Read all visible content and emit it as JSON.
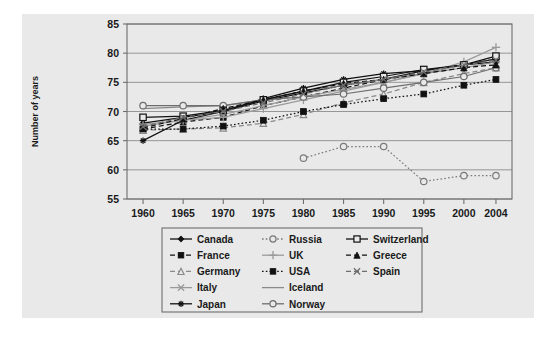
{
  "figure": {
    "background_color": "#e9e9e9",
    "plot_background_color": "#e9e9e9",
    "axis_color": "#6e6e6e",
    "gridline_color": "#8c8c8c"
  },
  "axes": {
    "ylabel": "Number of years",
    "xlabel": "",
    "yticks": [
      "85",
      "80",
      "75",
      "70",
      "65",
      "60",
      "55"
    ],
    "xticks": [
      "1960",
      "1965",
      "1970",
      "1975",
      "1980",
      "1985",
      "1990",
      "1995",
      "2000",
      "2004"
    ]
  },
  "legend": {
    "position": "below-plot",
    "columns": 3,
    "entries": [
      {
        "label": "Canada",
        "marker": "filled-diamond",
        "line": "solid",
        "color": "#111111"
      },
      {
        "label": "Russia",
        "marker": "open-circle",
        "line": "dotted",
        "color": "#7a7a7a"
      },
      {
        "label": "Switzerland",
        "marker": "open-square",
        "line": "solid",
        "color": "#111111"
      },
      {
        "label": "France",
        "marker": "filled-square",
        "line": "dashed",
        "color": "#111111"
      },
      {
        "label": "UK",
        "marker": "plus",
        "line": "solid",
        "color": "#9a9a9a"
      },
      {
        "label": "Greece",
        "marker": "filled-triangle",
        "line": "dashed",
        "color": "#111111"
      },
      {
        "label": "Germany",
        "marker": "open-triangle",
        "line": "dashed",
        "color": "#8a8a8a"
      },
      {
        "label": "USA",
        "marker": "filled-square",
        "line": "dotted",
        "color": "#111111"
      },
      {
        "label": "Spain",
        "marker": "x-mark",
        "line": "dashed",
        "color": "#6e6e6e"
      },
      {
        "label": "Italy",
        "marker": "x-mark",
        "line": "solid",
        "color": "#9a9a9a"
      },
      {
        "label": "Iceland",
        "marker": "none",
        "line": "solid",
        "color": "#8a8a8a"
      },
      {
        "label": "Japan",
        "marker": "asterisk",
        "line": "solid",
        "color": "#111111"
      },
      {
        "label": "Norway",
        "marker": "open-circle",
        "line": "solid",
        "color": "#6e6e6e"
      }
    ]
  },
  "chart_data": {
    "type": "line",
    "title": "",
    "xlabel": "",
    "ylabel": "Number of years",
    "x": [
      1960,
      1965,
      1970,
      1975,
      1980,
      1985,
      1990,
      1995,
      2000,
      2004
    ],
    "xlim": [
      1958,
      2006
    ],
    "ylim": [
      55,
      85
    ],
    "grid": true,
    "legend_position": "below",
    "series": [
      {
        "name": "Canada",
        "marker": "filled-diamond",
        "line": "solid",
        "color": "#111111",
        "x": [
          1960,
          1965,
          1970,
          1975,
          1980,
          1985,
          1990,
          1995,
          2000,
          2004
        ],
        "values": [
          68.0,
          69.0,
          70.0,
          71.8,
          73.2,
          74.5,
          75.5,
          77.0,
          78.0,
          78.5
        ]
      },
      {
        "name": "France",
        "marker": "filled-square",
        "line": "dashed",
        "color": "#111111",
        "x": [
          1960,
          1965,
          1970,
          1975,
          1980,
          1985,
          1990,
          1995,
          2000,
          2004
        ],
        "values": [
          67.0,
          68.2,
          69.0,
          71.0,
          72.5,
          74.0,
          75.5,
          76.8,
          78.0,
          79.0
        ]
      },
      {
        "name": "Germany",
        "marker": "open-triangle",
        "line": "dashed",
        "color": "#8a8a8a",
        "x": [
          1960,
          1965,
          1970,
          1975,
          1980,
          1985,
          1990,
          1995,
          2000,
          2004
        ],
        "values": [
          66.8,
          67.0,
          67.2,
          68.0,
          69.5,
          71.5,
          73.0,
          75.0,
          76.5,
          77.5
        ]
      },
      {
        "name": "Italy",
        "marker": "x-mark",
        "line": "solid",
        "color": "#9a9a9a",
        "x": [
          1960,
          1965,
          1970,
          1975,
          1980,
          1985,
          1990,
          1995,
          2000,
          2004
        ],
        "values": [
          67.5,
          68.5,
          69.5,
          71.0,
          72.5,
          73.8,
          75.0,
          76.5,
          78.0,
          79.0
        ]
      },
      {
        "name": "Japan",
        "marker": "asterisk",
        "line": "solid",
        "color": "#111111",
        "x": [
          1960,
          1965,
          1970,
          1975,
          1980,
          1985,
          1990,
          1995,
          2000,
          2004
        ],
        "values": [
          65.0,
          68.5,
          70.0,
          72.2,
          74.0,
          75.5,
          76.5,
          77.0,
          78.0,
          79.0
        ]
      },
      {
        "name": "Russia",
        "marker": "open-circle",
        "line": "dotted",
        "color": "#7a7a7a",
        "x": [
          1980,
          1985,
          1990,
          1995,
          2000,
          2004
        ],
        "values": [
          62.0,
          64.0,
          64.0,
          58.0,
          59.0,
          59.0
        ]
      },
      {
        "name": "UK",
        "marker": "plus",
        "line": "solid",
        "color": "#9a9a9a",
        "x": [
          1960,
          1965,
          1970,
          1975,
          1980,
          1985,
          1990,
          1995,
          2000,
          2004
        ],
        "values": [
          67.8,
          68.5,
          69.0,
          70.5,
          72.0,
          73.5,
          75.0,
          76.5,
          78.5,
          81.0
        ]
      },
      {
        "name": "USA",
        "marker": "filled-square",
        "line": "dotted",
        "color": "#111111",
        "x": [
          1960,
          1965,
          1970,
          1975,
          1980,
          1985,
          1990,
          1995,
          2000,
          2004
        ],
        "values": [
          67.0,
          67.0,
          67.5,
          68.5,
          70.0,
          71.2,
          72.2,
          73.0,
          74.5,
          75.5
        ]
      },
      {
        "name": "Iceland",
        "marker": "none",
        "line": "solid",
        "color": "#8a8a8a",
        "x": [
          1960,
          1965,
          1970,
          1975,
          1980,
          1985,
          1990,
          1995,
          2000,
          2004
        ],
        "values": [
          70.5,
          70.8,
          71.0,
          72.0,
          73.5,
          74.5,
          75.5,
          76.5,
          77.5,
          78.5
        ]
      },
      {
        "name": "Norway",
        "marker": "open-circle",
        "line": "solid",
        "color": "#6e6e6e",
        "x": [
          1960,
          1965,
          1970,
          1975,
          1980,
          1985,
          1990,
          1995,
          2000,
          2004
        ],
        "values": [
          71.0,
          71.0,
          71.0,
          72.0,
          72.5,
          73.0,
          74.0,
          75.0,
          76.0,
          77.5
        ]
      },
      {
        "name": "Switzerland",
        "marker": "open-square",
        "line": "solid",
        "color": "#111111",
        "x": [
          1960,
          1965,
          1970,
          1975,
          1980,
          1985,
          1990,
          1995,
          2000,
          2004
        ],
        "values": [
          69.0,
          69.2,
          70.2,
          72.0,
          73.5,
          75.0,
          76.0,
          77.2,
          78.0,
          79.5
        ]
      },
      {
        "name": "Greece",
        "marker": "filled-triangle",
        "line": "dashed",
        "color": "#111111",
        "x": [
          1960,
          1965,
          1970,
          1975,
          1980,
          1985,
          1990,
          1995,
          2000,
          2004
        ],
        "values": [
          67.2,
          68.8,
          70.5,
          72.0,
          73.5,
          74.8,
          75.5,
          76.5,
          77.5,
          78.0
        ]
      },
      {
        "name": "Spain",
        "marker": "x-mark",
        "line": "dashed",
        "color": "#6e6e6e",
        "x": [
          1960,
          1965,
          1970,
          1975,
          1980,
          1985,
          1990,
          1995,
          2000,
          2004
        ],
        "values": [
          67.4,
          69.0,
          70.0,
          71.5,
          73.0,
          74.5,
          75.5,
          76.8,
          78.0,
          78.8
        ]
      }
    ]
  }
}
